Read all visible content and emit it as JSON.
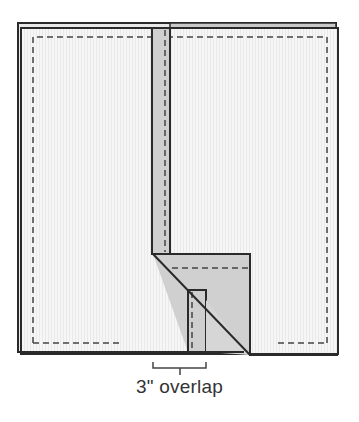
{
  "diagram": {
    "title": "",
    "caption": "3\" overlap",
    "colors": {
      "background": "#ffffff",
      "fabric": "#f4f4f4",
      "fabric_texture": "#e6e6e6",
      "strip_fill": "#cfcfcf",
      "outline": "#2a2a2a",
      "seam": "#444444",
      "back_sheet": "#9a9a9a"
    },
    "elements": [
      {
        "id": "back-fabric-sheet",
        "shape": "rect",
        "x": 18,
        "y": 23,
        "w": 318,
        "h": 329
      },
      {
        "id": "front-fabric-sheet",
        "shape": "rect",
        "x": 21,
        "y": 28,
        "w": 317,
        "h": 326
      },
      {
        "id": "seam-line",
        "shape": "dashed-rect",
        "x": 33,
        "y": 37,
        "w": 294,
        "h": 306
      },
      {
        "id": "vertical-strip",
        "shape": "rect",
        "x": 152,
        "y": 28,
        "w": 18,
        "h": 226
      },
      {
        "id": "folded-strip",
        "shape": "polygon",
        "points": "153,254 250,254 250,355 206,353 206,290 188,290 188,352 153,254"
      },
      {
        "id": "lower-strip",
        "shape": "rect",
        "x": 188,
        "y": 290,
        "w": 18,
        "h": 62
      },
      {
        "id": "overlap-bracket",
        "shape": "bracket",
        "x1": 153,
        "x2": 206,
        "y": 368
      }
    ]
  }
}
